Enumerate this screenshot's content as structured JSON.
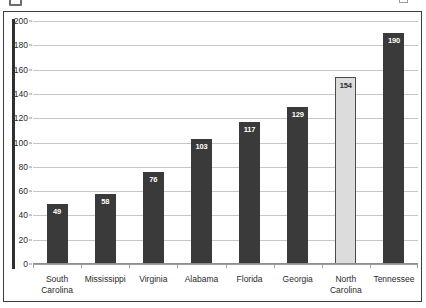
{
  "chart_data": {
    "type": "bar",
    "title": "",
    "xlabel": "",
    "ylabel": "",
    "ylim": [
      0,
      200
    ],
    "ytick_step": 20,
    "yticks": [
      0,
      20,
      40,
      60,
      80,
      100,
      120,
      140,
      160,
      180,
      200
    ],
    "grid": true,
    "legend": "none",
    "categories": [
      "South\nCarolina",
      "Mississippi",
      "Virginia",
      "Alabama",
      "Florida",
      "Georgia",
      "North\nCarolina",
      "Tennessee"
    ],
    "values": [
      49,
      58,
      76,
      103,
      117,
      129,
      154,
      190
    ],
    "value_labels": [
      "49",
      "58",
      "76",
      "103",
      "117",
      "129",
      "154",
      "190"
    ],
    "bar_styles": [
      "dark",
      "dark",
      "dark",
      "dark",
      "dark",
      "dark",
      "light",
      "dark"
    ],
    "highlighted_category": "North Carolina"
  },
  "colors": {
    "bar_dark": "#3a3a3a",
    "bar_light": "#dcdcdc",
    "bar_light_border": "#4a4a4a",
    "gridline": "#c6c6c6",
    "axis": "#2f2f2f",
    "background": "#ffffff",
    "text": "#2b2b2b",
    "value_label_on_dark": "#ffffff",
    "value_label_on_light": "#2b2b2b"
  }
}
